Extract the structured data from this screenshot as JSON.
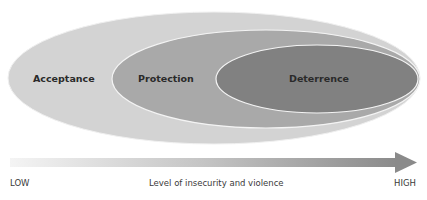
{
  "diagram": {
    "type": "nested-ellipses",
    "layers": [
      {
        "name": "outer",
        "label": "Acceptance",
        "color": "#d2d2d2"
      },
      {
        "name": "middle",
        "label": "Protection",
        "color": "#a8a8a8"
      },
      {
        "name": "inner",
        "label": "Deterrence",
        "color": "#808080"
      }
    ],
    "border_color": "#f4f4f4"
  },
  "axis": {
    "low_label": "LOW",
    "title": "Level of insecurity and violence",
    "high_label": "HIGH",
    "arrow_gradient_start": "#f2f2f2",
    "arrow_gradient_end": "#8a8a8a",
    "arrow_icon": "right-arrow-icon"
  }
}
